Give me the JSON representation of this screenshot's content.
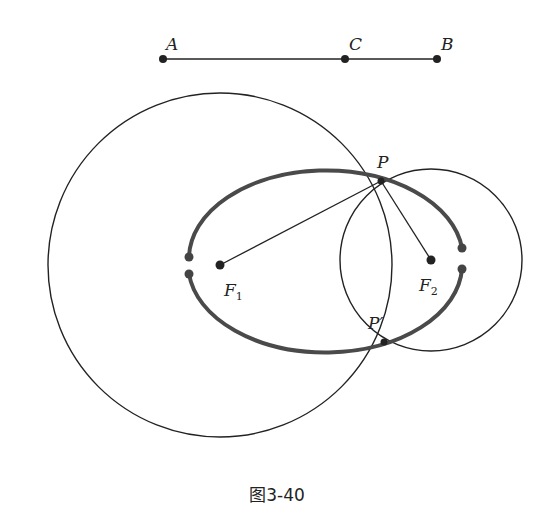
{
  "figure": {
    "caption": "图3-40",
    "colors": {
      "stroke": "#222222",
      "ellipse": "#4a4a4a",
      "background": "#ffffff"
    }
  },
  "segment": {
    "points": [
      {
        "label": "A",
        "x": 163,
        "y": 59
      },
      {
        "label": "C",
        "x": 345,
        "y": 59
      },
      {
        "label": "B",
        "x": 437,
        "y": 59
      }
    ]
  },
  "points": {
    "F1": {
      "label": "F",
      "sub": "1",
      "x": 220,
      "y": 265
    },
    "F2": {
      "label": "F",
      "sub": "2",
      "x": 431,
      "y": 260
    },
    "P": {
      "label": "P",
      "x": 381,
      "y": 181
    },
    "Pp": {
      "label": "P′",
      "x": 384,
      "y": 342
    }
  },
  "circles": [
    {
      "name": "circle-F1",
      "cx": 220,
      "cy": 265,
      "r": 172
    },
    {
      "name": "circle-F2",
      "cx": 431,
      "cy": 260,
      "r": 91
    }
  ],
  "ellipse": {
    "cx": 325,
    "cy": 263,
    "rx": 137,
    "ry": 88
  }
}
